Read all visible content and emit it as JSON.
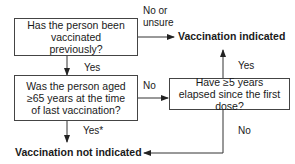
{
  "flowchart": {
    "questions": [
      {
        "id": "q1",
        "text": "Has the person been vaccinated previously?"
      },
      {
        "id": "q2",
        "text": "Was the person aged ≥65 years at the time of last vaccination?"
      },
      {
        "id": "q3",
        "text": "Have ≥5 years elapsed since the first dose?"
      }
    ],
    "outcomes": {
      "indicated": "Vaccination indicated",
      "not_indicated": "Vaccination not indicated"
    },
    "edge_labels": {
      "q1_no": "No or\nunsure",
      "q1_no_line1": "No or",
      "q1_no_line2": "unsure",
      "q1_yes": "Yes",
      "q2_no": "No",
      "q2_yes": "Yes*",
      "q3_yes": "Yes",
      "q3_no": "No"
    }
  }
}
